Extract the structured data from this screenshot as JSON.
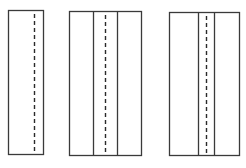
{
  "diagram": {
    "stroke_color": "#3a3a3a",
    "dash_color": "#2a2a2a",
    "background": "#ffffff",
    "figures": [
      {
        "id": "panel-1",
        "rect": {
          "x": 8,
          "y": 10,
          "w": 35,
          "h": 144
        },
        "solid_lines_x": [],
        "dashed_lines_x": [
          34
        ]
      },
      {
        "id": "panel-2",
        "rect": {
          "x": 69,
          "y": 11,
          "w": 72,
          "h": 144
        },
        "solid_lines_x": [
          93,
          117
        ],
        "dashed_lines_x": [
          105
        ]
      },
      {
        "id": "panel-3",
        "rect": {
          "x": 169,
          "y": 12,
          "w": 70,
          "h": 143
        },
        "solid_lines_x": [
          198,
          214
        ],
        "dashed_lines_x": [
          206
        ]
      }
    ]
  }
}
